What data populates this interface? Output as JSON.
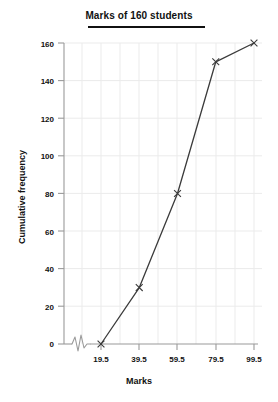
{
  "chart_data": {
    "type": "line",
    "title": "Marks of 160 students",
    "xlabel": "Marks",
    "ylabel": "Cumulative frequency",
    "x": [
      19.5,
      39.5,
      59.5,
      79.5,
      99.5
    ],
    "values": [
      0,
      30,
      80,
      150,
      160
    ],
    "xticklabels": [
      "19.5",
      "39.5",
      "59.5",
      "79.5",
      "99.5"
    ],
    "yticklabels": [
      "0",
      "20",
      "40",
      "60",
      "80",
      "100",
      "120",
      "140",
      "160"
    ],
    "yticks": [
      0,
      20,
      40,
      60,
      80,
      100,
      120,
      140,
      160
    ],
    "ylim": [
      0,
      160
    ],
    "xlim": [
      19.5,
      99.5
    ],
    "grid": true,
    "legend": null,
    "marker": "x",
    "line_color": "#3b3b3b",
    "grid_color": "#ebebeb",
    "axis_color": "#9a9a9a",
    "axis_break": true,
    "axis_break_note": "zigzag break on x-axis between origin and first tick"
  },
  "labels": {
    "tick_19_5": "19.5",
    "tick_39_5": "39.5",
    "tick_59_5": "59.5",
    "tick_79_5": "79.5",
    "tick_99_5": "99.5",
    "tick_0": "0",
    "tick_20": "20",
    "tick_40": "40",
    "tick_60": "60",
    "tick_80": "80",
    "tick_100": "100",
    "tick_120": "120",
    "tick_140": "140",
    "tick_160": "160"
  }
}
